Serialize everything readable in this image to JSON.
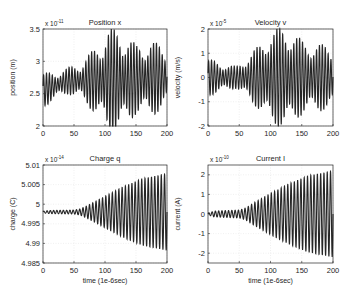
{
  "figure": {
    "width": 352,
    "height": 292,
    "background": "#ffffff",
    "line_color": "#262626",
    "grid_color": "#e6e6e6"
  },
  "chart_data": [
    {
      "type": "line",
      "title": "Position x",
      "xlabel": "",
      "ylabel": "position (m)",
      "exponent_label": "x 10",
      "exponent": "-11",
      "xlim": [
        0,
        200
      ],
      "ylim": [
        2,
        3.5
      ],
      "xticks": [
        "0",
        "50",
        "100",
        "150",
        "200"
      ],
      "yticks": [
        "2",
        "2.5",
        "3",
        "3.5"
      ],
      "ytick_values": [
        2,
        2.5,
        3,
        3.5
      ],
      "grid": true,
      "box": {
        "x0": 43,
        "y0": 29,
        "x1": 167,
        "y1": 126
      },
      "series": [
        {
          "name": "x(t)",
          "baseline": [
            [
              0,
              2.55
            ],
            [
              40,
              2.7
            ],
            [
              70,
              2.7
            ],
            [
              120,
              2.7
            ],
            [
              200,
              2.75
            ]
          ],
          "envelope": [
            [
              0,
              0.2
            ],
            [
              20,
              0.15
            ],
            [
              40,
              0.15
            ],
            [
              60,
              0.2
            ],
            [
              80,
              0.35
            ],
            [
              105,
              0.6
            ],
            [
              125,
              0.6
            ],
            [
              150,
              0.4
            ],
            [
              170,
              0.45
            ],
            [
              200,
              0.35
            ]
          ],
          "cycles": 44,
          "beat": 0.35
        }
      ]
    },
    {
      "type": "line",
      "title": "Velocity v",
      "xlabel": "",
      "ylabel": "velocity (m/s)",
      "exponent_label": "x 10",
      "exponent": "-5",
      "xlim": [
        0,
        200
      ],
      "ylim": [
        -2,
        2
      ],
      "xticks": [
        "0",
        "50",
        "100",
        "150",
        "200"
      ],
      "yticks": [
        "-2",
        "-1",
        "0",
        "1",
        "2"
      ],
      "ytick_values": [
        -2,
        -1,
        0,
        1,
        2
      ],
      "grid": true,
      "box": {
        "x0": 208,
        "y0": 29,
        "x1": 333,
        "y1": 126
      },
      "series": [
        {
          "name": "v(t)",
          "baseline": [
            [
              0,
              0
            ],
            [
              200,
              0
            ]
          ],
          "envelope": [
            [
              0,
              0.6
            ],
            [
              20,
              0.45
            ],
            [
              45,
              0.35
            ],
            [
              60,
              0.6
            ],
            [
              80,
              1.0
            ],
            [
              100,
              1.5
            ],
            [
              125,
              1.65
            ],
            [
              150,
              1.2
            ],
            [
              170,
              1.1
            ],
            [
              200,
              1.0
            ]
          ],
          "cycles": 44,
          "beat": 0.3
        }
      ]
    },
    {
      "type": "line",
      "title": "Charge q",
      "xlabel": "time (1e-6sec)",
      "ylabel": "charge (C)",
      "exponent_label": "x 10",
      "exponent": "-14",
      "xlim": [
        0,
        200
      ],
      "ylim": [
        4.985,
        5.01
      ],
      "xticks": [
        "0",
        "50",
        "100",
        "150",
        "200"
      ],
      "yticks": [
        "4.985",
        "4.99",
        "4.995",
        "5",
        "5.005",
        "5.01"
      ],
      "ytick_values": [
        4.985,
        4.99,
        4.995,
        5,
        5.005,
        5.01
      ],
      "grid": true,
      "box": {
        "x0": 43,
        "y0": 165,
        "x1": 167,
        "y1": 263
      },
      "series": [
        {
          "name": "q(t)",
          "baseline": [
            [
              0,
              4.998
            ],
            [
              200,
              4.998
            ]
          ],
          "envelope": [
            [
              0,
              0.0002
            ],
            [
              10,
              0.0004
            ],
            [
              50,
              0.0005
            ],
            [
              60,
              0.0008
            ],
            [
              70,
              0.0015
            ],
            [
              100,
              0.004
            ],
            [
              130,
              0.0065
            ],
            [
              160,
              0.0085
            ],
            [
              200,
              0.0098
            ]
          ],
          "cycles": 38,
          "beat": 0
        }
      ]
    },
    {
      "type": "line",
      "title": "Current I",
      "xlabel": "time (1e-6sec)",
      "ylabel": "current (A)",
      "exponent_label": "x 10",
      "exponent": "-10",
      "xlim": [
        0,
        200
      ],
      "ylim": [
        -2.5,
        2.5
      ],
      "xticks": [
        "0",
        "50",
        "100",
        "150",
        "200"
      ],
      "yticks": [
        "-2",
        "-1",
        "0",
        "1",
        "2"
      ],
      "ytick_values": [
        -2,
        -1,
        0,
        1,
        2
      ],
      "grid": true,
      "box": {
        "x0": 208,
        "y0": 165,
        "x1": 333,
        "y1": 263
      },
      "series": [
        {
          "name": "I(t)",
          "baseline": [
            [
              0,
              0
            ],
            [
              200,
              0
            ]
          ],
          "envelope": [
            [
              0,
              0.05
            ],
            [
              10,
              0.15
            ],
            [
              50,
              0.2
            ],
            [
              60,
              0.3
            ],
            [
              75,
              0.6
            ],
            [
              100,
              1.05
            ],
            [
              130,
              1.55
            ],
            [
              160,
              1.95
            ],
            [
              200,
              2.2
            ]
          ],
          "cycles": 38,
          "beat": 0
        }
      ]
    }
  ]
}
